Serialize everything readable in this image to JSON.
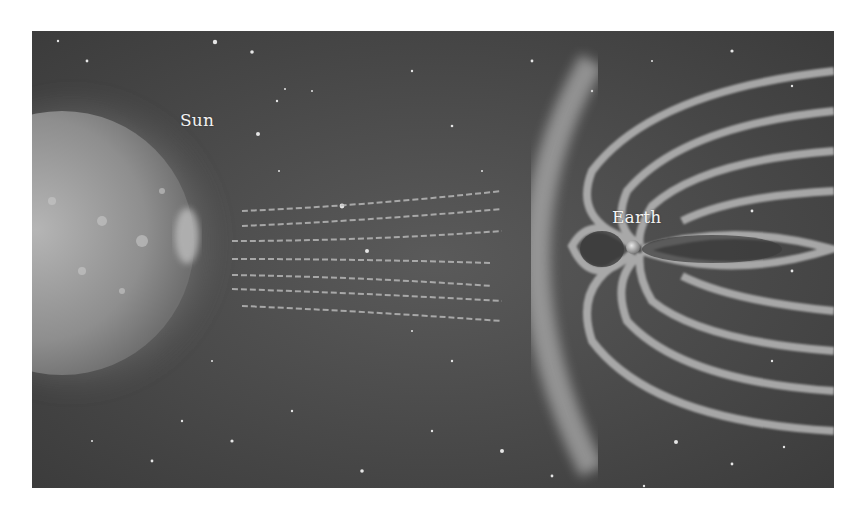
{
  "figure": {
    "type": "illustration",
    "labels": {
      "sun": "Sun",
      "earth": "Earth"
    },
    "colors": {
      "background_space": "#4a4a4a",
      "sun_surface": "#9a9a9a",
      "field_lines": "#bdbdbd",
      "label_text": "#f2f2f2",
      "page_background": "#ffffff"
    }
  }
}
